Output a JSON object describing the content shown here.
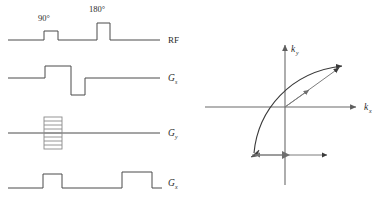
{
  "figure": {
    "stroke_color": "#4a4a4a",
    "axis_color": "#6b6b6b",
    "comb_color": "#8a8a8a",
    "vector_color": "#7d7d7d",
    "background": "#ffffff"
  },
  "pulse_sequence": {
    "rf": {
      "channel_label": "RF",
      "pulses": [
        {
          "label": "90°",
          "flip_angle_deg": 90,
          "center_x": 51,
          "width": 14,
          "height": 9
        },
        {
          "label": "180°",
          "flip_angle_deg": 180,
          "center_x": 104,
          "width": 13,
          "height": 17
        }
      ],
      "baseline_y": 40
    },
    "channels": [
      {
        "name": "slice-select",
        "label_main": "G",
        "label_sub": "s",
        "baseline_y": 78,
        "description": "positive slice-select lobe then negative rephasing lobe"
      },
      {
        "name": "phase-encode",
        "label_main": "G",
        "label_sub": "y",
        "baseline_y": 133,
        "description": "phase-encoding ladder (multiple stepped amplitudes)",
        "ladder_steps": 9
      },
      {
        "name": "readout",
        "label_main": "G",
        "label_sub": "x",
        "baseline_y": 188,
        "description": "dephasing lobe then readout lobe"
      }
    ]
  },
  "kspace": {
    "axis_x": {
      "label_main": "k",
      "label_sub": "x"
    },
    "axis_y": {
      "label_main": "k",
      "label_sub": "y"
    },
    "origin": {
      "x": 285,
      "y": 107
    },
    "trajectory": {
      "type": "curve-with-arrow",
      "start": {
        "x": 252,
        "y": 155
      },
      "end": {
        "x": 344,
        "y": 63
      },
      "description": "curved trajectory from lower-left corner of k-space sweeping up to upper-right"
    },
    "vectors": [
      {
        "name": "diagonal-vector",
        "from": {
          "x": 285,
          "y": 107
        },
        "to": {
          "x": 341,
          "y": 66
        },
        "description": "net vector from origin to upper-right"
      },
      {
        "name": "short-diagonal-vector",
        "from": {
          "x": 285,
          "y": 107
        },
        "to": {
          "x": 312,
          "y": 88
        },
        "description": "short vector from origin toward upper-right"
      },
      {
        "name": "prephase-vector",
        "from": {
          "x": 285,
          "y": 155
        },
        "to": {
          "x": 252,
          "y": 155
        },
        "description": "leftward arrow along lower horizontal line"
      },
      {
        "name": "readout-vector",
        "from": {
          "x": 252,
          "y": 155
        },
        "to": {
          "x": 330,
          "y": 155
        },
        "description": "rightward readout arrow along lower horizontal line"
      }
    ]
  }
}
